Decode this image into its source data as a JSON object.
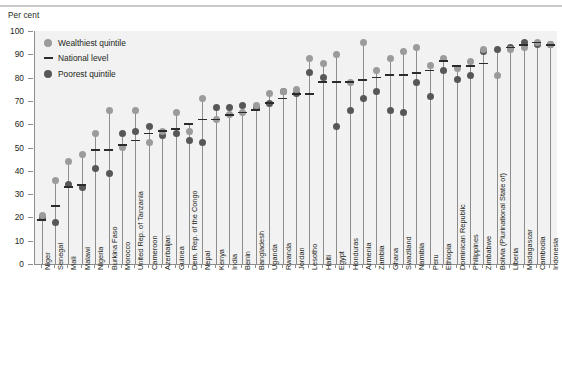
{
  "axis_title": "Per cent",
  "legend": {
    "items": [
      {
        "key": "wealthiest",
        "label": "Wealthiest quintile",
        "marker": "circle",
        "color": "#9b9b9b"
      },
      {
        "key": "national",
        "label": "National level",
        "marker": "line",
        "color": "#2b2b2b"
      },
      {
        "key": "poorest",
        "label": "Poorest quintile",
        "marker": "circle",
        "color": "#575757"
      }
    ]
  },
  "chart_data": {
    "type": "scatter",
    "title": "",
    "xlabel": "",
    "ylabel": "Per cent",
    "ylim": [
      0,
      100
    ],
    "yticks": [
      0,
      10,
      20,
      30,
      40,
      50,
      60,
      70,
      80,
      90,
      100
    ],
    "grid": false,
    "legend_position": "top-left",
    "categories": [
      "Niger",
      "Senegal",
      "Mali",
      "Malawi",
      "Nigeria",
      "Burkina Faso",
      "Morocco",
      "United Rep. of Tanzania",
      "Cameroon",
      "Azerbaijan",
      "Guinea",
      "Dem. Rep. of the Congo",
      "Nepal",
      "Kenya",
      "India",
      "Benin",
      "Bangladesh",
      "Uganda",
      "Rwanda",
      "Jordan",
      "Lesotho",
      "Haiti",
      "Egypt",
      "Honduras",
      "Armenia",
      "Zambia",
      "Ghana",
      "Swaziland",
      "Namibia",
      "Peru",
      "Ethiopia",
      "Dominican Republic",
      "Philippines",
      "Zimbabwe",
      "Bolivia (Plurinational State of)",
      "Liberia",
      "Madagascar",
      "Cambodia",
      "Indonesia"
    ],
    "series": [
      {
        "name": "Wealthiest quintile",
        "color": "#9b9b9b",
        "values": [
          21,
          36,
          44,
          47,
          56,
          66,
          50,
          66,
          52,
          57,
          65,
          57,
          71,
          62,
          64,
          65,
          68,
          73,
          74,
          75,
          88,
          86,
          90,
          78,
          95,
          83,
          88,
          91,
          93,
          85,
          88,
          84,
          87,
          92,
          81,
          92,
          93,
          95,
          94
        ]
      },
      {
        "name": "National level",
        "color": "#2b2b2b",
        "values": [
          19,
          25,
          33,
          34,
          49,
          49,
          51,
          53,
          56,
          57,
          58,
          60,
          62,
          62,
          64,
          65,
          66,
          69,
          71,
          73,
          73,
          78,
          78,
          78,
          79,
          80,
          81,
          81,
          82,
          83,
          87,
          85,
          85,
          86,
          null,
          93,
          94,
          95,
          94
        ]
      },
      {
        "name": "Poorest quintile",
        "color": "#575757",
        "values": [
          20,
          18,
          34,
          33,
          41,
          39,
          56,
          57,
          59,
          55,
          56,
          53,
          52,
          67,
          67,
          68,
          67,
          69,
          74,
          73,
          82,
          80,
          59,
          66,
          71,
          74,
          66,
          65,
          78,
          72,
          83,
          79,
          81,
          91,
          92,
          93,
          95,
          94,
          94
        ]
      }
    ]
  }
}
